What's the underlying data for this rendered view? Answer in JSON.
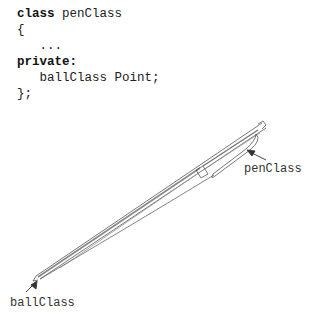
{
  "code": {
    "line1_keyword": "class",
    "line1_rest": " penClass",
    "line2": "{",
    "line3": "   ...",
    "line4_keyword": "private:",
    "line5": "   ballClass Point;",
    "line6": "};"
  },
  "labels": {
    "pen": "penClass",
    "ball": "ballClass"
  },
  "icons": {
    "pen": "pen-illustration",
    "arrow": "arrow-pointer"
  }
}
